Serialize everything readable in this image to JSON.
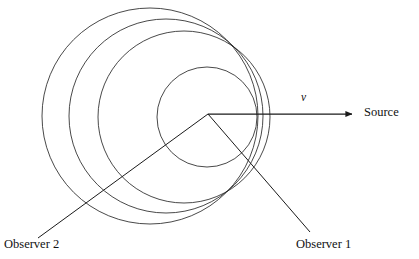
{
  "figure": {
    "background_color": "#ffffff",
    "stroke_color": "#1a1a1a",
    "width": 419,
    "height": 259
  },
  "labels": {
    "source": "Source",
    "velocity": "v",
    "observer_1": "Observer 1",
    "observer_2": "Observer 2"
  },
  "chart_data": {
    "type": "scatter",
    "xlabel": "",
    "ylabel": "",
    "xlim": [
      0,
      419
    ],
    "ylim": [
      0,
      259
    ],
    "grid": false,
    "legend": "none",
    "source_position": {
      "x": 208,
      "y": 114
    },
    "wavefronts": [
      {
        "name": "wavefront-1-outermost",
        "cx": 150,
        "cy": 116,
        "r": 108
      },
      {
        "name": "wavefront-2",
        "cx": 166,
        "cy": 116,
        "r": 97
      },
      {
        "name": "wavefront-3",
        "cx": 184,
        "cy": 117,
        "r": 86
      },
      {
        "name": "wavefront-4-innermost",
        "cx": 207,
        "cy": 117,
        "r": 50
      }
    ],
    "velocity_arrow": {
      "name": "velocity-arrow",
      "x1": 208,
      "y1": 114,
      "x2": 358,
      "y2": 114,
      "label": "v"
    },
    "observer_lines": [
      {
        "name": "observer-1-line",
        "x1": 208,
        "y1": 114,
        "x2": 310,
        "y2": 232,
        "label": "Observer 1"
      },
      {
        "name": "observer-2-line",
        "x1": 208,
        "y1": 114,
        "x2": 38,
        "y2": 238,
        "label": "Observer 2"
      }
    ]
  }
}
